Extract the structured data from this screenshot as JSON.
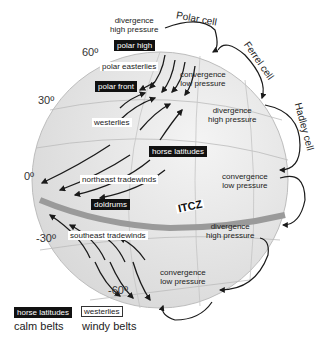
{
  "latitudes": [
    "60º",
    "30º",
    "0º",
    "-30º",
    "-60º"
  ],
  "cells": {
    "polar": "Polar cell",
    "ferrel": "Ferrel cell",
    "hadley": "Hadley cell"
  },
  "pressure_labels": [
    {
      "line1": "divergence",
      "line2": "high pressure"
    },
    {
      "line1": "convergence",
      "line2": "low pressure"
    },
    {
      "line1": "divergence",
      "line2": "high pressure"
    },
    {
      "line1": "convergence",
      "line2": "low pressure"
    },
    {
      "line1": "divergence",
      "line2": "high pressure"
    },
    {
      "line1": "convergence",
      "line2": "low pressure"
    }
  ],
  "calm_belts": {
    "polar_high": "polar high",
    "polar_front": "polar front",
    "horse_latitudes": "horse latitudes",
    "doldrums": "doldrums"
  },
  "windy_belts": {
    "polar_easterlies": "polar easterlies",
    "westerlies": "westerlies",
    "northeast_tradewinds": "northeast tradewinds",
    "southeast_tradewinds": "southeast tradewinds"
  },
  "itcz": "ITCZ",
  "legend": {
    "calm_sample": "horse latitudes",
    "calm_caption": "calm belts",
    "windy_sample": "westerlies",
    "windy_caption": "windy belts"
  },
  "colors": {
    "globe_fill": "#e9e9e9",
    "itcz_band": "#9a9a9a",
    "calm_bg": "#111111",
    "arrow": "#1a1a1a"
  }
}
